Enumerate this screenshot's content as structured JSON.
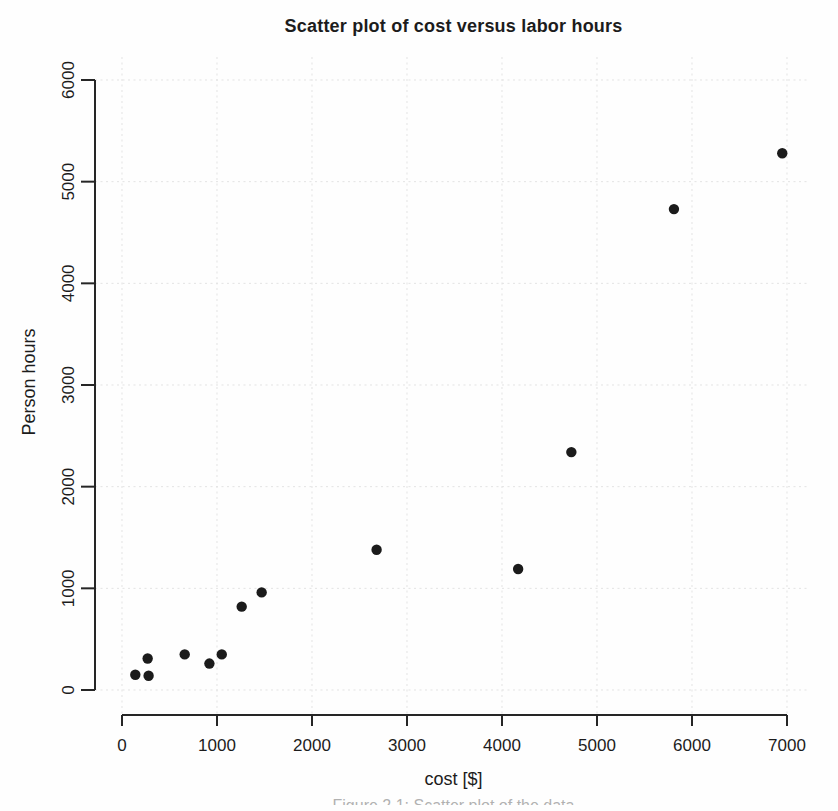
{
  "figure": {
    "caption_clipped": "Figure 2.1: Scatter plot of the data"
  },
  "chart_data": {
    "type": "scatter",
    "title": "Scatter plot of cost versus labor hours",
    "xlabel": "cost [$]",
    "ylabel": "Person hours",
    "xlim": [
      0,
      7000
    ],
    "ylim": [
      0,
      6000
    ],
    "x_ticks": [
      0,
      1000,
      2000,
      3000,
      4000,
      5000,
      6000,
      7000
    ],
    "y_ticks": [
      0,
      1000,
      2000,
      3000,
      4000,
      5000,
      6000
    ],
    "grid": "dotted-both-axes",
    "legend_position": "none",
    "marker": "filled-circle",
    "colors": {
      "point": "#1b1b1b",
      "axis": "#262626",
      "grid": "#e3e3e3",
      "text": "#1c1c1c",
      "background": "#fefefe"
    },
    "points": [
      {
        "cost": 140,
        "hours": 150
      },
      {
        "cost": 280,
        "hours": 140
      },
      {
        "cost": 270,
        "hours": 310
      },
      {
        "cost": 660,
        "hours": 350
      },
      {
        "cost": 920,
        "hours": 260
      },
      {
        "cost": 1050,
        "hours": 350
      },
      {
        "cost": 1260,
        "hours": 820
      },
      {
        "cost": 1470,
        "hours": 960
      },
      {
        "cost": 2680,
        "hours": 1380
      },
      {
        "cost": 4170,
        "hours": 1190
      },
      {
        "cost": 4730,
        "hours": 2340
      },
      {
        "cost": 5810,
        "hours": 4730
      },
      {
        "cost": 6950,
        "hours": 5280
      }
    ]
  }
}
